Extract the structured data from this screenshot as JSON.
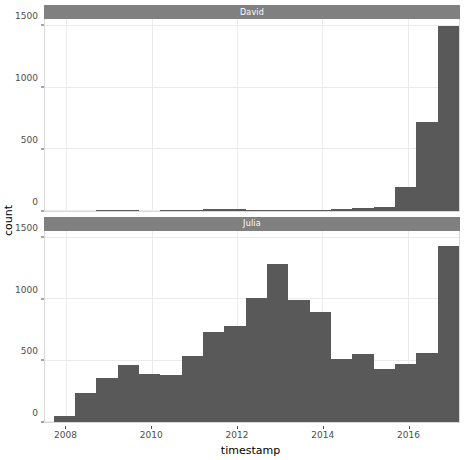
{
  "chart_data": {
    "type": "bar",
    "subtype": "histogram",
    "title": "",
    "xlabel": "timestamp",
    "ylabel": "count",
    "grid": true,
    "legend": null,
    "facet_layout": "vertical-stack",
    "xlim": [
      2007.5,
      2017.2
    ],
    "ylim": [
      0,
      1560
    ],
    "xticks": [
      2008,
      2010,
      2012,
      2014,
      2016
    ],
    "xtick_labels": [
      "2008",
      "2010",
      "2012",
      "2014",
      "2016"
    ],
    "yticks": [
      0,
      500,
      1000,
      1500
    ],
    "ytick_labels": [
      "0",
      "500",
      "1000",
      "1500"
    ],
    "bin_width": 0.5,
    "bar_color": "#595959",
    "strip_color": "#808080",
    "strip_text_color": "#ffffff",
    "panel_border_color": "#d9d9d9",
    "gridline_color": "#ebebeb",
    "axis_text_color": "#4d4d4d",
    "facets": [
      {
        "name": "David",
        "bins": [
          {
            "x0": 2007.7,
            "x1": 2008.2,
            "value": 0
          },
          {
            "x0": 2008.2,
            "x1": 2008.7,
            "value": 0
          },
          {
            "x0": 2008.7,
            "x1": 2009.2,
            "value": 5
          },
          {
            "x0": 2009.2,
            "x1": 2009.7,
            "value": 5
          },
          {
            "x0": 2009.7,
            "x1": 2010.2,
            "value": 0
          },
          {
            "x0": 2010.2,
            "x1": 2010.7,
            "value": 4
          },
          {
            "x0": 2010.7,
            "x1": 2011.2,
            "value": 6
          },
          {
            "x0": 2011.2,
            "x1": 2011.7,
            "value": 12
          },
          {
            "x0": 2011.7,
            "x1": 2012.2,
            "value": 10
          },
          {
            "x0": 2012.2,
            "x1": 2012.7,
            "value": 5
          },
          {
            "x0": 2012.7,
            "x1": 2013.2,
            "value": 4
          },
          {
            "x0": 2013.2,
            "x1": 2013.7,
            "value": 4
          },
          {
            "x0": 2013.7,
            "x1": 2014.2,
            "value": 5
          },
          {
            "x0": 2014.2,
            "x1": 2014.7,
            "value": 14
          },
          {
            "x0": 2014.7,
            "x1": 2015.2,
            "value": 22
          },
          {
            "x0": 2015.2,
            "x1": 2015.7,
            "value": 28
          },
          {
            "x0": 2015.7,
            "x1": 2016.2,
            "value": 195
          },
          {
            "x0": 2016.2,
            "x1": 2016.7,
            "value": 720
          },
          {
            "x0": 2016.7,
            "x1": 2017.2,
            "value": 770
          }
        ],
        "peak_value": 1500,
        "peak_bins_extra": [
          {
            "x0": 2016.7,
            "x1": 2017.2,
            "value": 1500
          },
          {
            "x0": 2017.2,
            "x1": 2017.7,
            "value": 950
          }
        ]
      },
      {
        "name": "Julia",
        "bins": [
          {
            "x0": 2007.7,
            "x1": 2008.2,
            "value": 50
          },
          {
            "x0": 2008.2,
            "x1": 2008.7,
            "value": 240
          },
          {
            "x0": 2008.7,
            "x1": 2009.2,
            "value": 360
          },
          {
            "x0": 2009.2,
            "x1": 2009.7,
            "value": 465
          },
          {
            "x0": 2009.7,
            "x1": 2010.2,
            "value": 395
          },
          {
            "x0": 2010.2,
            "x1": 2010.7,
            "value": 380
          },
          {
            "x0": 2010.7,
            "x1": 2011.2,
            "value": 535
          },
          {
            "x0": 2011.2,
            "x1": 2011.7,
            "value": 730
          },
          {
            "x0": 2011.7,
            "x1": 2012.2,
            "value": 780
          },
          {
            "x0": 2012.2,
            "x1": 2012.7,
            "value": 1010
          },
          {
            "x0": 2012.7,
            "x1": 2013.2,
            "value": 1290
          },
          {
            "x0": 2013.2,
            "x1": 2013.7,
            "value": 995
          },
          {
            "x0": 2013.7,
            "x1": 2014.2,
            "value": 900
          },
          {
            "x0": 2014.2,
            "x1": 2014.7,
            "value": 510
          },
          {
            "x0": 2014.7,
            "x1": 2015.2,
            "value": 550
          },
          {
            "x0": 2015.2,
            "x1": 2015.7,
            "value": 435
          },
          {
            "x0": 2015.7,
            "x1": 2016.2,
            "value": 475
          },
          {
            "x0": 2016.2,
            "x1": 2016.7,
            "value": 560
          },
          {
            "x0": 2016.7,
            "x1": 2017.2,
            "value": 1435
          },
          {
            "x0": 2017.2,
            "x1": 2017.7,
            "value": 1125
          }
        ]
      }
    ]
  }
}
